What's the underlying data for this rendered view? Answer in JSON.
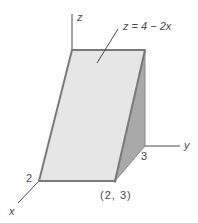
{
  "figure": {
    "labels": {
      "z_axis": "z",
      "y_axis": "y",
      "x_axis": "x",
      "x_tick": "2",
      "y_tick": "3",
      "corner_point": "(2, 3)",
      "surface_equation": "z = 4 − 2x"
    },
    "colors": {
      "front_face": "#e6e6e6",
      "side_face": "#a9a9a9",
      "edge": "#7a7a7a",
      "axis": "#4a4a4a",
      "text": "#4a4a4a"
    }
  }
}
